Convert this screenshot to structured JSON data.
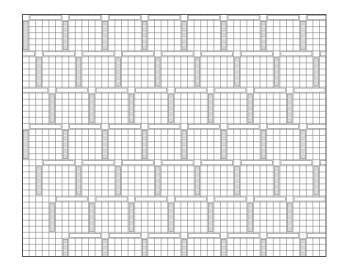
{
  "pattern": {
    "type": "woven-brick-pinwheel",
    "cols": 46,
    "rows": 40,
    "cell_w": 6.6,
    "cell_h": 6.05,
    "bar_len": 5,
    "colors": {
      "background": "#ffffff",
      "cell_fill": "#ffffff",
      "bar_fill": "#d9d9d9",
      "grid_line": "#8a8a8a",
      "border": "#555555"
    }
  }
}
